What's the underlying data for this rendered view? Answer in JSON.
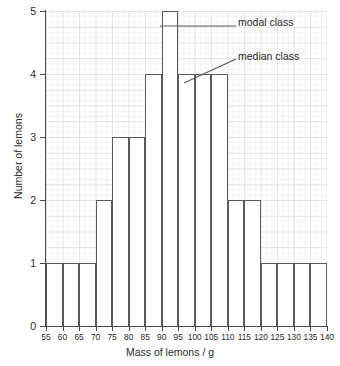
{
  "chart_data": {
    "type": "bar",
    "title": "",
    "xlabel": "Mass of lemons / g",
    "ylabel": "Number of lemons",
    "xlim": [
      55,
      140
    ],
    "ylim": [
      0,
      5
    ],
    "grid": true,
    "legend": "none",
    "bin_width": 5,
    "x_ticks": [
      "55",
      "60",
      "65",
      "70",
      "75",
      "80",
      "85",
      "90",
      "95",
      "100",
      "105",
      "110",
      "115",
      "120",
      "125",
      "130",
      "135",
      "140"
    ],
    "y_ticks": [
      "0",
      "1",
      "2",
      "3",
      "4",
      "5"
    ],
    "categories": [
      "55-60",
      "60-65",
      "65-70",
      "70-75",
      "75-80",
      "80-85",
      "85-90",
      "90-95",
      "95-100",
      "100-105",
      "105-110",
      "110-115",
      "115-120",
      "120-125",
      "125-130",
      "130-135",
      "135-140"
    ],
    "values": [
      1,
      1,
      1,
      2,
      3,
      3,
      4,
      5,
      4,
      4,
      4,
      2,
      2,
      1,
      1,
      1,
      1
    ],
    "annotations": [
      {
        "name": "modal-class",
        "text": "modal class",
        "points_to_bin": "90-95",
        "leader": {
          "x1": 160,
          "y1": 26,
          "x2": 236,
          "y2": 26
        }
      },
      {
        "name": "median-class",
        "text": "median class",
        "points_to_bin": "95-100",
        "leader": {
          "x1": 184,
          "y1": 83,
          "x2": 236,
          "y2": 59
        }
      }
    ],
    "colors": {
      "bar_fill": "#ffffff",
      "bar_stroke": "#5a5a5a",
      "axis": "#4a4a4a",
      "grid": "#c9c9d2",
      "text": "#2b2b2b",
      "background": "#ffffff"
    }
  }
}
